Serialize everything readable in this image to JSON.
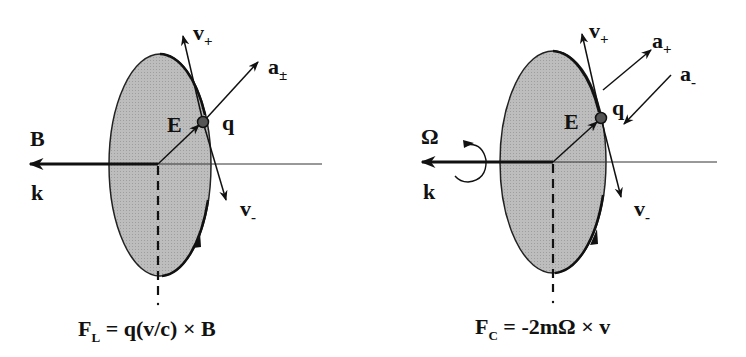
{
  "colors": {
    "ink": "#111111",
    "disk_fill": "#b5b5b5",
    "background": "#ffffff"
  },
  "left_panel": {
    "field_label": "B",
    "axis_label": "k",
    "e_label": "E",
    "charge_label": "q",
    "v_plus": {
      "base": "v",
      "sub": "+"
    },
    "v_minus": {
      "base": "v",
      "sub": "-"
    },
    "accel": {
      "base": "a",
      "sub": "±"
    },
    "formula": {
      "lhs": "F",
      "lhs_sub": "L",
      "rhs": " = q(v/c) × B"
    }
  },
  "right_panel": {
    "field_label": "Ω",
    "axis_label": "k",
    "e_label": "E",
    "charge_label": "q",
    "v_plus": {
      "base": "v",
      "sub": "+"
    },
    "v_minus": {
      "base": "v",
      "sub": "-"
    },
    "accel_plus": {
      "base": "a",
      "sub": "+"
    },
    "accel_minus": {
      "base": "a",
      "sub": "-"
    },
    "formula": {
      "lhs": "F",
      "lhs_sub": "C",
      "rhs": " = -2mΩ × v"
    }
  }
}
